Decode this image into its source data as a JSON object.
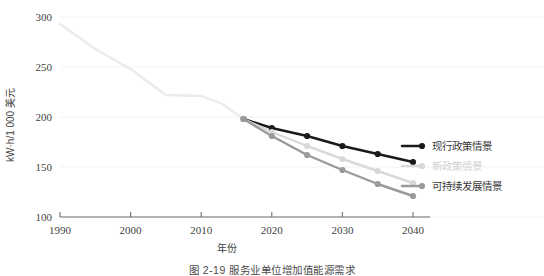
{
  "figure": {
    "caption": "图 2-19    服务业单位增加值能源需求",
    "ylabel": "kW·h/1 000 美元",
    "xlabel": "年份"
  },
  "legend": {
    "items": [
      {
        "label": "现行政策情景",
        "color": "#1a1a1a"
      },
      {
        "label": "新政策情景",
        "color": "#d9d9d9"
      },
      {
        "label": "可持续发展情景",
        "color": "#9a9a9a"
      }
    ]
  },
  "chart_data": {
    "type": "line",
    "title": "图 2-19    服务业单位增加值能源需求",
    "xlabel": "年份",
    "ylabel": "kW·h/1 000 美元",
    "xlim": [
      1990,
      2040
    ],
    "ylim": [
      100,
      300
    ],
    "xticks": [
      1990,
      2000,
      2010,
      2020,
      2030,
      2040
    ],
    "yticks": [
      100,
      150,
      200,
      250,
      300
    ],
    "grid": true,
    "legend_position": "right",
    "series": [
      {
        "name": "历史",
        "color": "#ebebeb",
        "markers": false,
        "x": [
          1990,
          1995,
          2000,
          2005,
          2010,
          2013,
          2016
        ],
        "values": [
          293,
          268,
          248,
          222,
          221,
          213,
          198
        ]
      },
      {
        "name": "现行政策情景",
        "color": "#1a1a1a",
        "markers": true,
        "x": [
          2016,
          2020,
          2025,
          2030,
          2035,
          2040
        ],
        "values": [
          198,
          189,
          181,
          171,
          163,
          155
        ]
      },
      {
        "name": "新政策情景",
        "color": "#d9d9d9",
        "markers": true,
        "x": [
          2016,
          2020,
          2025,
          2030,
          2035,
          2040
        ],
        "values": [
          198,
          185,
          171,
          158,
          146,
          134
        ]
      },
      {
        "name": "可持续发展情景",
        "color": "#9a9a9a",
        "markers": true,
        "x": [
          2016,
          2020,
          2025,
          2030,
          2035,
          2040
        ],
        "values": [
          198,
          181,
          162,
          147,
          133,
          121
        ]
      }
    ]
  }
}
